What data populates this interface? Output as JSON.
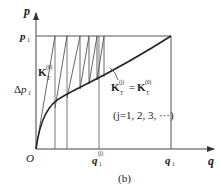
{
  "figure": {
    "caption": "(b)",
    "axes": {
      "y_label": "p",
      "x_label": "q",
      "origin_label": "O"
    },
    "labels": {
      "p1": {
        "base": "p",
        "sub": "1"
      },
      "delta_p1": {
        "prefix": "Δ",
        "base": "p",
        "sub": "1"
      },
      "q1": {
        "base": "q",
        "sub": "1"
      },
      "q1_j": {
        "base": "q",
        "sub": "1",
        "sup": "(j)"
      },
      "K_T0": {
        "base": "K",
        "sub": "T",
        "sup": "(0)"
      },
      "equation": {
        "lhs_base": "K",
        "lhs_sub": "T",
        "lhs_sup": "(j)",
        "eq": "=",
        "rhs_base": "K",
        "rhs_sub": "T",
        "rhs_sup": "(0)"
      },
      "j_range": "(j=1, 2, 3, ···)"
    },
    "colors": {
      "line": "#555555",
      "curve": "#222222",
      "text": "#222222"
    }
  }
}
